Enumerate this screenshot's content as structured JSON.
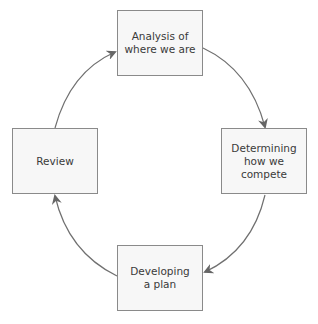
{
  "diagram": {
    "type": "cycle",
    "colors": {
      "box_fill": "#f7f7f7",
      "box_border": "#8a8a8a",
      "arrow": "#666666",
      "text": "#3a3a3a"
    },
    "nodes": [
      {
        "id": "analysis",
        "line1": "Analysis of",
        "line2": "where we are"
      },
      {
        "id": "determining",
        "line1": "Determining",
        "line2": "how we compete"
      },
      {
        "id": "developing",
        "line1": "Developing",
        "line2": "a plan"
      },
      {
        "id": "review",
        "line1": "Review",
        "line2": ""
      }
    ],
    "edges": [
      {
        "from": "analysis",
        "to": "determining"
      },
      {
        "from": "determining",
        "to": "developing"
      },
      {
        "from": "developing",
        "to": "review"
      },
      {
        "from": "review",
        "to": "analysis"
      }
    ]
  }
}
